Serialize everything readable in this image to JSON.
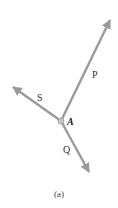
{
  "diagram": {
    "point": {
      "label": "A",
      "x": 61,
      "y": 121
    },
    "vectors": [
      {
        "name": "P",
        "label": "P",
        "tip": [
          112,
          17
        ],
        "label_pos": [
          94,
          77
        ]
      },
      {
        "name": "S",
        "label": "S",
        "tip": [
          10,
          85
        ],
        "label_pos": [
          40,
          101
        ]
      },
      {
        "name": "Q",
        "label": "Q",
        "tip": [
          91,
          176
        ],
        "label_pos": [
          65,
          152
        ]
      }
    ],
    "caption": "(a)",
    "colors": {
      "vector": "#9a9a9a",
      "point": "#b0b0b0"
    }
  }
}
